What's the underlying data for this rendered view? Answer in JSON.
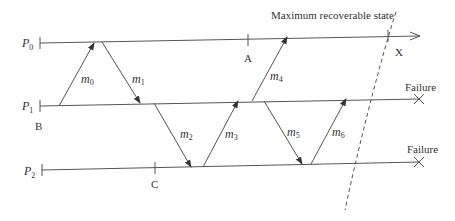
{
  "processes": [
    {
      "name": "P",
      "sub": "0"
    },
    {
      "name": "P",
      "sub": "1"
    },
    {
      "name": "P",
      "sub": "2"
    }
  ],
  "messages": [
    {
      "label": "m",
      "sub": "0"
    },
    {
      "label": "m",
      "sub": "1"
    },
    {
      "label": "m",
      "sub": "2"
    },
    {
      "label": "m",
      "sub": "3"
    },
    {
      "label": "m",
      "sub": "4"
    },
    {
      "label": "m",
      "sub": "5"
    },
    {
      "label": "m",
      "sub": "6"
    }
  ],
  "checkpoints": {
    "a": "A",
    "b": "B",
    "c": "C",
    "x": "X"
  },
  "failure_label_1": "Failure",
  "failure_label_2": "Failure",
  "cut_label": "Maximum recoverable state"
}
